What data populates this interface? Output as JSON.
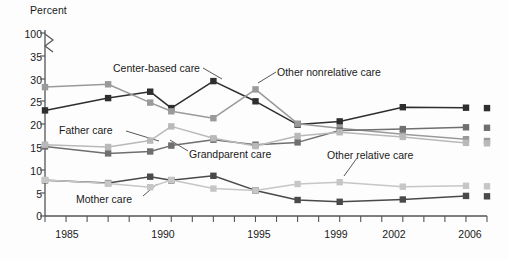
{
  "chart_data": {
    "type": "line",
    "title": "",
    "ylabel": "Percent",
    "xlabel": "",
    "ylim": [
      0,
      35
    ],
    "yticks": [
      "0",
      "5",
      "10",
      "15",
      "20",
      "25",
      "30",
      "35",
      "100"
    ],
    "axis_break": true,
    "axis_break_note": "y-axis broken between 35 and 100",
    "grid": false,
    "legend_position": "inline-annotations",
    "x": [
      1985,
      1988,
      1990,
      1991,
      1993,
      1995,
      1997,
      1999,
      2002,
      2005,
      2006
    ],
    "xticks_labeled": [
      "1985",
      "1990",
      "1995",
      "1999",
      "2002",
      "2006"
    ],
    "xtick_every_year_from": 1985,
    "xtick_every_year_to": 2006,
    "detached_year": 2006,
    "series": [
      {
        "name": "Center-based care",
        "color": "#2e2e2e",
        "values": [
          23.1,
          25.8,
          27.2,
          23.6,
          29.5,
          25.1,
          20.0,
          20.7,
          23.8,
          23.7,
          23.6
        ]
      },
      {
        "name": "Other nonrelative care",
        "color": "#9a9a9a",
        "values": [
          28.2,
          28.8,
          24.8,
          22.9,
          21.4,
          27.7,
          20.2,
          19.2,
          17.9,
          16.8,
          16.4
        ]
      },
      {
        "name": "Grandparent care",
        "color": "#6f6f6f",
        "values": [
          15.2,
          13.7,
          14.1,
          15.4,
          16.7,
          15.6,
          16.1,
          18.7,
          19.0,
          19.4,
          19.3
        ]
      },
      {
        "name": "Father care",
        "color": "#b9b9b9",
        "values": [
          15.6,
          15.1,
          16.5,
          19.6,
          17.0,
          15.3,
          17.5,
          18.3,
          17.3,
          16.0,
          15.9
        ]
      },
      {
        "name": "Mother care",
        "color": "#4a4a4a",
        "values": [
          7.8,
          7.2,
          8.6,
          7.8,
          8.8,
          5.6,
          3.5,
          3.1,
          3.6,
          4.4,
          4.3
        ]
      },
      {
        "name": "Other relative care",
        "color": "#c6c6c6",
        "values": [
          7.9,
          7.1,
          6.3,
          7.9,
          6.0,
          5.6,
          7.0,
          7.4,
          6.4,
          6.6,
          6.5
        ]
      }
    ],
    "annotations": [
      {
        "text": "Center-based care",
        "target_series": "Center-based care",
        "target_year": 1993
      },
      {
        "text": "Other nonrelative care",
        "target_series": "Other nonrelative care",
        "target_year": 1995
      },
      {
        "text": "Father care",
        "target_series": "Father care",
        "target_year": 1990
      },
      {
        "text": "Grandparent care",
        "target_series": "Grandparent care",
        "target_year": 1991
      },
      {
        "text": "Other relative care",
        "target_series": "Other relative care",
        "target_year": 1999
      },
      {
        "text": "Mother care",
        "target_series": "Mother care",
        "target_year": 1990
      }
    ]
  },
  "axis": {
    "y_title": "Percent",
    "y_ticks": [
      "100",
      "35",
      "30",
      "25",
      "20",
      "15",
      "10",
      "5",
      "0"
    ],
    "x_ticks": [
      "1985",
      "1990",
      "1995",
      "1999",
      "2002",
      "2006"
    ]
  },
  "labels": {
    "center_based": "Center-based care",
    "other_nonrelative": "Other nonrelative care",
    "grandparent": "Grandparent care",
    "father": "Father care",
    "other_relative": "Other relative care",
    "mother": "Mother care"
  }
}
